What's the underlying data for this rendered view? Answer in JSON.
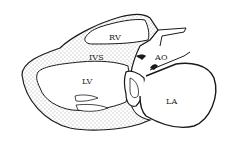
{
  "diagram": {
    "type": "anatomical line drawing",
    "labels": [
      {
        "id": "rv",
        "text": "RV",
        "x": 109,
        "y": 33
      },
      {
        "id": "ivs",
        "text": "IVS",
        "x": 89,
        "y": 53
      },
      {
        "id": "ao",
        "text": "AO",
        "x": 155,
        "y": 53
      },
      {
        "id": "lv",
        "text": "LV",
        "x": 82,
        "y": 77
      },
      {
        "id": "la",
        "text": "LA",
        "x": 166,
        "y": 97
      }
    ],
    "colors": {
      "ink": "#1a1a1a",
      "background": "#ffffff",
      "stipple": "#444444"
    }
  }
}
